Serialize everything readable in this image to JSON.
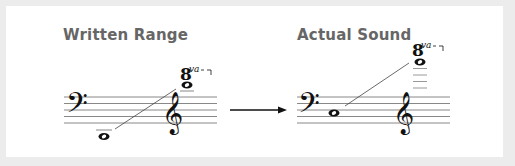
{
  "diagram": {
    "panels": [
      {
        "title": "Written Range",
        "ottava_label": "va"
      },
      {
        "title": "Actual Sound",
        "ottava_label": "va"
      }
    ],
    "ottava_numeral": "8",
    "arrow": "right-arrow",
    "colors": {
      "background": "#ececec",
      "panel": "#ffffff",
      "title": "#666666",
      "ink": "#111111",
      "staff": "#777777"
    }
  }
}
